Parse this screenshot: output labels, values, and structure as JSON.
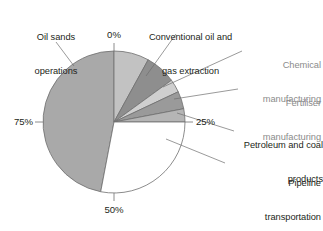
{
  "chart_data": {
    "type": "pie",
    "title": "",
    "unit": "%",
    "axis_ticks": [
      "0%",
      "25%",
      "50%",
      "75%"
    ],
    "grid": false,
    "legend": "callout-labels",
    "center": {
      "x": 114,
      "y": 122
    },
    "radius": 71,
    "categories": [
      "Oil sands operations",
      "Conventional oil and gas extraction",
      "Chemical manufacturing",
      "Fertiliser manufacturing",
      "Petroleum and coal products",
      "Pipeline transportation"
    ],
    "values": [
      47,
      8,
      7,
      3,
      4,
      3
    ],
    "colors": [
      "#a9a9a9",
      "#c2c2c2",
      "#8e8e8e",
      "#cfcfcf",
      "#9a9a9a",
      "#b5b5b5"
    ],
    "remainder_value": 28,
    "remainder_color": "#ffffff",
    "xlabel": "",
    "ylabel": "",
    "slices": [
      {
        "name": "Oil sands operations",
        "value": 47,
        "start_pct": 53,
        "end_pct": 100,
        "color": "#a9a9a9"
      },
      {
        "name": "Conventional oil and gas extraction",
        "value": 8,
        "start_pct": 0,
        "end_pct": 8,
        "color": "#c2c2c2"
      },
      {
        "name": "Chemical manufacturing",
        "value": 7,
        "start_pct": 8,
        "end_pct": 15,
        "color": "#8e8e8e"
      },
      {
        "name": "Fertiliser manufacturing",
        "value": 3,
        "start_pct": 15,
        "end_pct": 18,
        "color": "#cfcfcf"
      },
      {
        "name": "Petroleum and coal products",
        "value": 4,
        "start_pct": 18,
        "end_pct": 22,
        "color": "#9a9a9a"
      },
      {
        "name": "Pipeline transportation",
        "value": 3,
        "start_pct": 22,
        "end_pct": 25,
        "color": "#b5b5b5"
      },
      {
        "name": "",
        "value": 28,
        "start_pct": 25,
        "end_pct": 53,
        "color": "#ffffff"
      }
    ]
  },
  "labels": {
    "oil_sands_line1": "Oil sands",
    "oil_sands_line2": "operations",
    "conventional_line1": "Conventional oil and",
    "conventional_line2": "gas extraction",
    "chemical_line1": "Chemical",
    "chemical_line2": "manufacturing",
    "fertiliser_line1": "Fertiliser",
    "fertiliser_line2": "manufacturing",
    "petroleum_line1": "Petroleum and coal",
    "petroleum_line2": "products",
    "pipeline_line1": "Pipeline",
    "pipeline_line2": "transportation"
  },
  "ticks": {
    "top": "0%",
    "right": "25%",
    "bottom": "50%",
    "left": "75%"
  },
  "title_sliver": ""
}
